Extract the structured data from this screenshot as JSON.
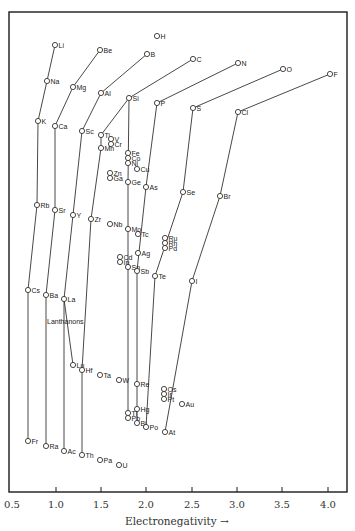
{
  "chart_data": {
    "type": "scatter",
    "title": "",
    "xlabel": "Electronegativity →",
    "ylabel": "",
    "xlim": [
      0.5,
      4.1
    ],
    "xticks": [
      0.5,
      1.0,
      1.5,
      2.0,
      2.5,
      3.0,
      3.5,
      4.0
    ],
    "xtick_labels": [
      "0.5",
      "1.0",
      "1.5",
      "2.0",
      "2.5",
      "3.0",
      "3.5",
      "4.0"
    ],
    "grid": false,
    "legend": null,
    "annotations": [
      {
        "text": "Lanthanons",
        "x": 1.1,
        "near": "La"
      }
    ],
    "points": [
      {
        "el": "H",
        "en": 2.1,
        "px": 157,
        "py": 36
      },
      {
        "el": "Li",
        "en": 1.0,
        "px": 55,
        "py": 45
      },
      {
        "el": "Be",
        "en": 1.5,
        "px": 100,
        "py": 50
      },
      {
        "el": "B",
        "en": 2.0,
        "px": 147,
        "py": 54
      },
      {
        "el": "C",
        "en": 2.5,
        "px": 193,
        "py": 59
      },
      {
        "el": "N",
        "en": 3.0,
        "px": 238,
        "py": 63
      },
      {
        "el": "O",
        "en": 3.5,
        "px": 283,
        "py": 69
      },
      {
        "el": "F",
        "en": 4.0,
        "px": 330,
        "py": 74
      },
      {
        "el": "Na",
        "en": 0.9,
        "px": 47,
        "py": 81
      },
      {
        "el": "Mg",
        "en": 1.2,
        "px": 73,
        "py": 87
      },
      {
        "el": "Al",
        "en": 1.5,
        "px": 101,
        "py": 93
      },
      {
        "el": "Si",
        "en": 1.8,
        "px": 129,
        "py": 98
      },
      {
        "el": "P",
        "en": 2.1,
        "px": 157,
        "py": 103
      },
      {
        "el": "S",
        "en": 2.5,
        "px": 193,
        "py": 108
      },
      {
        "el": "Cl",
        "en": 3.0,
        "px": 238,
        "py": 112
      },
      {
        "el": "K",
        "en": 0.8,
        "px": 38,
        "py": 121
      },
      {
        "el": "Ca",
        "en": 1.0,
        "px": 55,
        "py": 126
      },
      {
        "el": "Sc",
        "en": 1.3,
        "px": 82,
        "py": 131
      },
      {
        "el": "Ti",
        "en": 1.5,
        "px": 101,
        "py": 135
      },
      {
        "el": "V",
        "en": 1.6,
        "px": 111,
        "py": 139
      },
      {
        "el": "Cr",
        "en": 1.6,
        "px": 111,
        "py": 144
      },
      {
        "el": "Mn",
        "en": 1.5,
        "px": 101,
        "py": 148
      },
      {
        "el": "Fe",
        "en": 1.8,
        "px": 128,
        "py": 153
      },
      {
        "el": "Co",
        "en": 1.8,
        "px": 128,
        "py": 158
      },
      {
        "el": "Ni",
        "en": 1.8,
        "px": 128,
        "py": 163
      },
      {
        "el": "Cu",
        "en": 1.9,
        "px": 137,
        "py": 169
      },
      {
        "el": "Zn",
        "en": 1.6,
        "px": 110,
        "py": 173
      },
      {
        "el": "Ga",
        "en": 1.6,
        "px": 110,
        "py": 178
      },
      {
        "el": "Ge",
        "en": 1.8,
        "px": 128,
        "py": 182
      },
      {
        "el": "As",
        "en": 2.0,
        "px": 146,
        "py": 187
      },
      {
        "el": "Se",
        "en": 2.4,
        "px": 183,
        "py": 192
      },
      {
        "el": "Br",
        "en": 2.8,
        "px": 220,
        "py": 196
      },
      {
        "el": "Rb",
        "en": 0.8,
        "px": 37,
        "py": 205
      },
      {
        "el": "Sr",
        "en": 1.0,
        "px": 55,
        "py": 210
      },
      {
        "el": "Y",
        "en": 1.2,
        "px": 73,
        "py": 215
      },
      {
        "el": "Zr",
        "en": 1.4,
        "px": 91,
        "py": 219
      },
      {
        "el": "Nb",
        "en": 1.6,
        "px": 110,
        "py": 224
      },
      {
        "el": "Mo",
        "en": 1.8,
        "px": 128,
        "py": 229
      },
      {
        "el": "Tc",
        "en": 1.9,
        "px": 138,
        "py": 234
      },
      {
        "el": "Ru",
        "en": 2.2,
        "px": 165,
        "py": 238
      },
      {
        "el": "Rh",
        "en": 2.2,
        "px": 165,
        "py": 243
      },
      {
        "el": "Pd",
        "en": 2.2,
        "px": 165,
        "py": 248
      },
      {
        "el": "Ag",
        "en": 1.9,
        "px": 138,
        "py": 253
      },
      {
        "el": "Cd",
        "en": 1.7,
        "px": 120,
        "py": 257
      },
      {
        "el": "In",
        "en": 1.7,
        "px": 120,
        "py": 262
      },
      {
        "el": "Sn",
        "en": 1.8,
        "px": 128,
        "py": 267
      },
      {
        "el": "Sb",
        "en": 1.9,
        "px": 137,
        "py": 271
      },
      {
        "el": "Te",
        "en": 2.1,
        "px": 155,
        "py": 276
      },
      {
        "el": "I",
        "en": 2.5,
        "px": 192,
        "py": 281
      },
      {
        "el": "Cs",
        "en": 0.7,
        "px": 28,
        "py": 290
      },
      {
        "el": "Ba",
        "en": 0.9,
        "px": 46,
        "py": 295
      },
      {
        "el": "La",
        "en": 1.1,
        "px": 64,
        "py": 299
      },
      {
        "el": "Lu",
        "en": 1.2,
        "px": 73,
        "py": 365
      },
      {
        "el": "Hf",
        "en": 1.3,
        "px": 82,
        "py": 370
      },
      {
        "el": "Ta",
        "en": 1.5,
        "px": 100,
        "py": 375
      },
      {
        "el": "W",
        "en": 1.7,
        "px": 119,
        "py": 380
      },
      {
        "el": "Re",
        "en": 1.9,
        "px": 137,
        "py": 384
      },
      {
        "el": "Os",
        "en": 2.2,
        "px": 164,
        "py": 389
      },
      {
        "el": "Ir",
        "en": 2.2,
        "px": 164,
        "py": 394
      },
      {
        "el": "Pt",
        "en": 2.2,
        "px": 164,
        "py": 399
      },
      {
        "el": "Au",
        "en": 2.4,
        "px": 182,
        "py": 404
      },
      {
        "el": "Hg",
        "en": 1.9,
        "px": 137,
        "py": 409
      },
      {
        "el": "Tl",
        "en": 1.8,
        "px": 128,
        "py": 413
      },
      {
        "el": "Pb",
        "en": 1.8,
        "px": 128,
        "py": 418
      },
      {
        "el": "Bi",
        "en": 1.9,
        "px": 137,
        "py": 423
      },
      {
        "el": "Po",
        "en": 2.0,
        "px": 146,
        "py": 427
      },
      {
        "el": "At",
        "en": 2.2,
        "px": 165,
        "py": 432
      },
      {
        "el": "Fr",
        "en": 0.7,
        "px": 28,
        "py": 441
      },
      {
        "el": "Ra",
        "en": 0.9,
        "px": 46,
        "py": 446
      },
      {
        "el": "Ac",
        "en": 1.1,
        "px": 64,
        "py": 451
      },
      {
        "el": "Th",
        "en": 1.3,
        "px": 82,
        "py": 455
      },
      {
        "el": "Pa",
        "en": 1.5,
        "px": 100,
        "py": 460
      },
      {
        "el": "U",
        "en": 1.7,
        "px": 119,
        "py": 465
      }
    ],
    "links": [
      [
        "Li",
        "Na"
      ],
      [
        "Na",
        "K"
      ],
      [
        "K",
        "Rb"
      ],
      [
        "Rb",
        "Cs"
      ],
      [
        "Cs",
        "Fr"
      ],
      [
        "Be",
        "Mg"
      ],
      [
        "Mg",
        "Ca"
      ],
      [
        "Ca",
        "Sr"
      ],
      [
        "Sr",
        "Ba"
      ],
      [
        "Ba",
        "Ra"
      ],
      [
        "B",
        "Al"
      ],
      [
        "Al",
        "Sc"
      ],
      [
        "Sc",
        "Y"
      ],
      [
        "Y",
        "La"
      ],
      [
        "La",
        "Lu"
      ],
      [
        "La",
        "Ac"
      ],
      [
        "C",
        "Si"
      ],
      [
        "Si",
        "Ti"
      ],
      [
        "Ti",
        "Mn"
      ],
      [
        "Mn",
        "Zr"
      ],
      [
        "Zr",
        "Hf"
      ],
      [
        "Hf",
        "Th"
      ],
      [
        "Si",
        "Ge"
      ],
      [
        "Ge",
        "Sn"
      ],
      [
        "Sn",
        "Pb"
      ],
      [
        "N",
        "P"
      ],
      [
        "P",
        "As"
      ],
      [
        "As",
        "Sb"
      ],
      [
        "Sb",
        "Bi"
      ],
      [
        "O",
        "S"
      ],
      [
        "S",
        "Se"
      ],
      [
        "Se",
        "Te"
      ],
      [
        "Te",
        "Po"
      ],
      [
        "F",
        "Cl"
      ],
      [
        "Cl",
        "Br"
      ],
      [
        "Br",
        "I"
      ],
      [
        "I",
        "At"
      ]
    ]
  },
  "axis": {
    "xlabel": "Electronegativity →",
    "ticks": [
      {
        "label": "0.5",
        "px": 12
      },
      {
        "label": "1.0",
        "px": 56
      },
      {
        "label": "1.5",
        "px": 101
      },
      {
        "label": "2.0",
        "px": 146
      },
      {
        "label": "2.5",
        "px": 192
      },
      {
        "label": "3.0",
        "px": 237
      },
      {
        "label": "3.5",
        "px": 282
      },
      {
        "label": "4.0",
        "px": 328
      }
    ]
  },
  "annotation": {
    "text": "Lanthanons"
  }
}
